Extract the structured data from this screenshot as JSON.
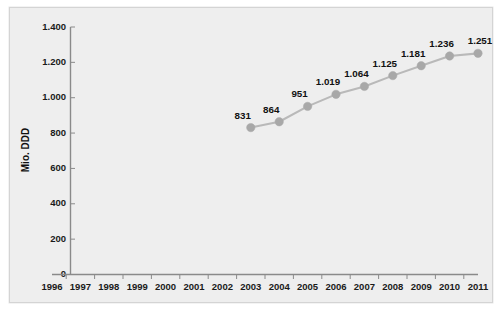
{
  "chart_data": {
    "type": "line",
    "title": "",
    "xlabel": "",
    "ylabel": "Mio. DDD",
    "categories": [
      "1996",
      "1997",
      "1998",
      "1999",
      "2000",
      "2001",
      "2002",
      "2003",
      "2004",
      "2005",
      "2006",
      "2007",
      "2008",
      "2009",
      "2010",
      "2011"
    ],
    "x_tick_labels": [
      "1996",
      "1997",
      "1998",
      "1999",
      "2000",
      "2001",
      "2002",
      "2003",
      "2004",
      "2005",
      "2006",
      "2007",
      "2008",
      "2009",
      "2010",
      "2011"
    ],
    "y_tick_labels": [
      "0",
      "200",
      "400",
      "600",
      "800",
      "1.000",
      "1.200",
      "1.400"
    ],
    "y_tick_values": [
      0,
      200,
      400,
      600,
      800,
      1000,
      1200,
      1400
    ],
    "ylim": [
      0,
      1400
    ],
    "xlim_years": [
      1996,
      2011
    ],
    "grid": false,
    "legend": false,
    "legend_position": "none",
    "number_format": "de-DE",
    "series": [
      {
        "name": "Mio. DDD",
        "line_color": "#b9b9b9",
        "marker_color": "#a8a8a8",
        "points": [
          {
            "x": "2003",
            "year": 2003,
            "value": 831,
            "label": "831"
          },
          {
            "x": "2004",
            "year": 2004,
            "value": 864,
            "label": "864"
          },
          {
            "x": "2005",
            "year": 2005,
            "value": 951,
            "label": "951"
          },
          {
            "x": "2006",
            "year": 2006,
            "value": 1019,
            "label": "1.019"
          },
          {
            "x": "2007",
            "year": 2007,
            "value": 1064,
            "label": "1.064"
          },
          {
            "x": "2008",
            "year": 2008,
            "value": 1125,
            "label": "1.125"
          },
          {
            "x": "2009",
            "year": 2009,
            "value": 1181,
            "label": "1.181"
          },
          {
            "x": "2010",
            "year": 2010,
            "value": 1236,
            "label": "1.236"
          },
          {
            "x": "2011",
            "year": 2011,
            "value": 1251,
            "label": "1.251"
          }
        ]
      }
    ],
    "colors": {
      "plot_background": "#eeeeee",
      "frame_border": "#d4d4d4",
      "axis": "#8a8a8a",
      "text": "#111111",
      "line": "#b9b9b9",
      "marker": "#a8a8a8"
    }
  }
}
